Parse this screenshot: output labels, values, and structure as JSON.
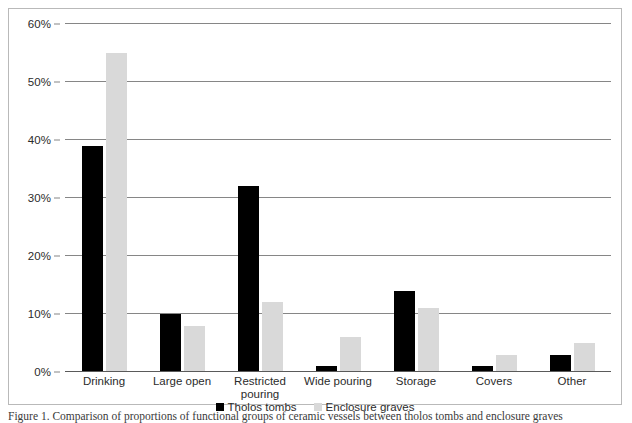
{
  "chart_data": {
    "type": "bar",
    "title": "",
    "subtitle": "",
    "xlabel": "",
    "ylabel": "",
    "categories": [
      "Drinking",
      "Large open",
      "Restricted pouring",
      "Wide pouring",
      "Storage",
      "Covers",
      "Other"
    ],
    "series": [
      {
        "name": "Tholos tombs",
        "color": "#000000",
        "values": [
          39,
          10,
          32,
          1,
          14,
          1,
          3
        ]
      },
      {
        "name": "Enclosure graves",
        "color": "#d9d9d9",
        "values": [
          55,
          8,
          12,
          6,
          11,
          3,
          5
        ]
      }
    ],
    "ylim": [
      0,
      60
    ],
    "ytick_values": [
      0,
      10,
      20,
      30,
      40,
      50,
      60
    ],
    "ytick_labels": [
      "0%",
      "10%",
      "20%",
      "30%",
      "40%",
      "50%",
      "60%"
    ],
    "grid": true,
    "legend_position": "bottom",
    "value_suffix": "%"
  },
  "caption": {
    "text": "Figure 1. Comparison of proportions of functional groups of ceramic vessels between tholos tombs and enclosure graves"
  }
}
